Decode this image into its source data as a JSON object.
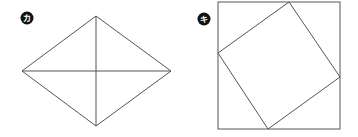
{
  "figures": [
    {
      "id": "ka",
      "label": "カ",
      "shape": "rhombus with both diagonals"
    },
    {
      "id": "ki",
      "label": "キ",
      "shape": "square inscribed (rotated) in a larger square"
    }
  ],
  "colors": {
    "line": "#555555",
    "badge": "#111111",
    "badge_text": "#ffffff"
  }
}
